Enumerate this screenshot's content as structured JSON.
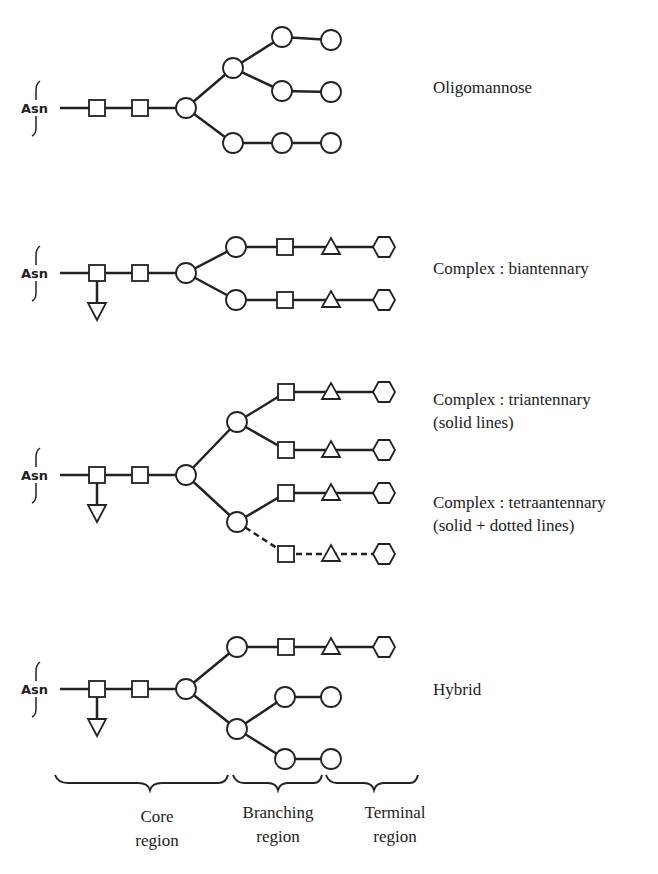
{
  "structures": [
    {
      "name": "Oligomannose",
      "label_lines": [
        "Oligomannose"
      ]
    },
    {
      "name": "Complex biantennary",
      "label_lines": [
        "Complex : biantennary"
      ]
    },
    {
      "name": "Complex triantennary",
      "label_lines": [
        "Complex : triantennary",
        "(solid lines)"
      ]
    },
    {
      "name": "Complex tetraantennary",
      "label_lines": [
        "Complex : tetraantennary",
        "(solid + dotted lines)"
      ]
    },
    {
      "name": "Hybrid",
      "label_lines": [
        "Hybrid"
      ]
    }
  ],
  "anchor_label": "Asn",
  "regions": [
    {
      "name": "core",
      "lines": [
        "Core",
        "region"
      ]
    },
    {
      "name": "branching",
      "lines": [
        "Branching",
        "region"
      ]
    },
    {
      "name": "terminal",
      "lines": [
        "Terminal",
        "region"
      ]
    }
  ],
  "symbols": {
    "square": "square-icon",
    "circle": "circle-icon",
    "triangle_up": "triangle-icon",
    "triangle_down": "fucose-triangle-icon",
    "hexagon": "hexagon-icon"
  }
}
